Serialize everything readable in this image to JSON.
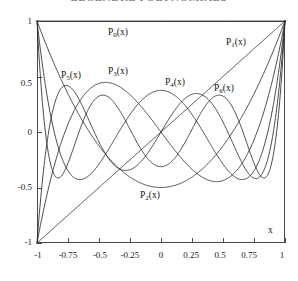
{
  "chart_data": {
    "type": "line",
    "title": "LEGENDRE POLYNOMIALS",
    "title_note": "clipped at top edge of screenshot",
    "xlabel": "x",
    "ylabel": "",
    "xlim": [
      -1,
      1
    ],
    "ylim": [
      -1,
      1
    ],
    "grid": false,
    "legend_position": "inline-labels",
    "xticks": [
      -1,
      -0.75,
      -0.5,
      -0.25,
      0,
      0.25,
      0.5,
      0.75,
      1
    ],
    "xtick_labels": [
      "-1",
      "-0.75",
      "-0.5",
      "-0.25",
      "0",
      "0.25",
      "0.5",
      "0.75",
      "1"
    ],
    "yticks": [
      -1,
      -0.5,
      0,
      0.5,
      1
    ],
    "ytick_labels": [
      "-1",
      "-0.5",
      "0",
      "0.5",
      "1"
    ],
    "series": [
      {
        "name": "P0(x)",
        "label": "P",
        "sub": "0",
        "suffix": "(x)",
        "degree": 0
      },
      {
        "name": "P1(x)",
        "label": "P",
        "sub": "1",
        "suffix": "(x)",
        "degree": 1
      },
      {
        "name": "P2(x)",
        "label": "P",
        "sub": "2",
        "suffix": "(x)",
        "degree": 2
      },
      {
        "name": "P3(x)",
        "label": "P",
        "sub": "3",
        "suffix": "(x)",
        "degree": 3
      },
      {
        "name": "P4(x)",
        "label": "P",
        "sub": "4",
        "suffix": "(x)",
        "degree": 4
      },
      {
        "name": "P5(x)",
        "label": "P",
        "sub": "5",
        "suffix": "(x)",
        "degree": 5
      },
      {
        "name": "P6(x)",
        "label": "P",
        "sub": "6",
        "suffix": "(x)",
        "degree": 6
      }
    ],
    "annotations": [
      {
        "text": "P0(x)",
        "x": -0.18,
        "y": 0.84
      },
      {
        "text": "P1(x)",
        "x": 0.67,
        "y": 0.78
      },
      {
        "text": "P5(x)",
        "x": -0.68,
        "y": 0.45
      },
      {
        "text": "P3(x)",
        "x": -0.4,
        "y": 0.52
      },
      {
        "text": "P4(x)",
        "x": 0.17,
        "y": 0.42
      },
      {
        "text": "P6(x)",
        "x": 0.54,
        "y": 0.39
      },
      {
        "text": "P2(x)",
        "x": 0.02,
        "y": -0.62
      }
    ],
    "line_color": "#2a2a2a",
    "axis_color": "#4a4a4a"
  },
  "labels": {
    "curve_0": {
      "base": "P",
      "sub": "0",
      "tail": "(x)"
    },
    "curve_1": {
      "base": "P",
      "sub": "1",
      "tail": "(x)"
    },
    "curve_2": {
      "base": "P",
      "sub": "2",
      "tail": "(x)"
    },
    "curve_3": {
      "base": "P",
      "sub": "3",
      "tail": "(x)"
    },
    "curve_4": {
      "base": "P",
      "sub": "4",
      "tail": "(x)"
    },
    "curve_5": {
      "base": "P",
      "sub": "5",
      "tail": "(x)"
    },
    "curve_6": {
      "base": "P",
      "sub": "6",
      "tail": "(x)"
    },
    "axis_x": "x"
  },
  "ytick_labels": {
    "t0": "1",
    "t1": "0.5",
    "t2": "0",
    "t3": "-0.5",
    "t4": "-1"
  },
  "xtick_labels": {
    "t0": "-1",
    "t1": "-0.75",
    "t2": "-0.5",
    "t3": "-0.25",
    "t4": "0",
    "t5": "0.25",
    "t6": "0.5",
    "t7": "0.75",
    "t8": "1"
  }
}
